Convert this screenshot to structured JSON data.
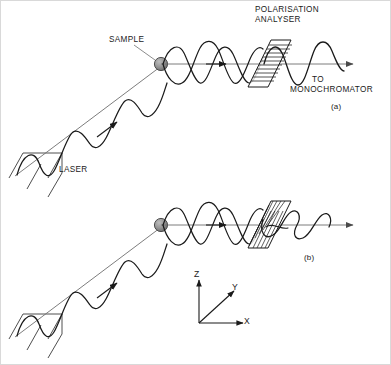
{
  "figure": {
    "width": 391,
    "height": 365,
    "background_color": "#ffffff",
    "border_color": "#d9d9d9",
    "ink_color": "#1a1a1a",
    "beam_axis_color": "#6e6e6e",
    "sample_fill_color": "#8c8c8c"
  },
  "labels": {
    "polarisation_analyser_line1": "POLARISATION",
    "polarisation_analyser_line2": "ANALYSER",
    "sample": "SAMPLE",
    "laser": "LASER",
    "to_line1": "TO",
    "to_line2": "MONOCHROMATOR",
    "caption_a": "(a)",
    "caption_b": "(b)"
  },
  "axes_indicator": {
    "name": "coordinate-axes",
    "origin_label": "",
    "z_label": "Z",
    "y_label": "Y",
    "x_label": "X"
  },
  "panels": [
    {
      "id": "a",
      "caption": "(a)",
      "analyser_orientation": "vertical-hatch",
      "incident_beam": "plane-polarised",
      "scattered_beam": "depolarised-helical",
      "transmitted_beam": "vertically-polarised-sine"
    },
    {
      "id": "b",
      "caption": "(b)",
      "analyser_orientation": "diagonal-hatch",
      "incident_beam": "plane-polarised",
      "scattered_beam": "depolarised-helical",
      "transmitted_beam": "horizontally-polarised-edge-on"
    }
  ]
}
